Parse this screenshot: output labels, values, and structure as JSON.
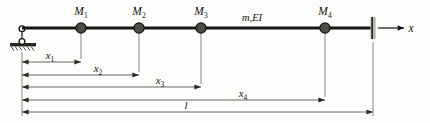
{
  "figure": {
    "type": "structural-beam-diagram",
    "colors": {
      "beam": "#171512",
      "mass_fill": "#4d4b48",
      "mass_stroke": "#141210",
      "dimension_line": "#55534f",
      "ground_hatch": "#26241f",
      "wall": "#b9b7b2",
      "background": "#fdfdfc"
    },
    "axis": {
      "label": "x"
    },
    "beam_property_label": "m,EI",
    "masses": [
      {
        "label": "M",
        "subscript": "1",
        "x": 81
      },
      {
        "label": "M",
        "subscript": "2",
        "x": 139
      },
      {
        "label": "M",
        "subscript": "3",
        "x": 201
      },
      {
        "label": "M",
        "subscript": "4",
        "x": 325
      }
    ],
    "dimensions": [
      {
        "label": "x",
        "subscript": "1",
        "start": 22,
        "end": 81,
        "y": 62,
        "text_x": 50,
        "text_y": 59
      },
      {
        "label": "x",
        "subscript": "2",
        "start": 22,
        "end": 139,
        "y": 75,
        "text_x": 98,
        "text_y": 72
      },
      {
        "label": "x",
        "subscript": "3",
        "start": 22,
        "end": 201,
        "y": 87,
        "text_x": 160,
        "text_y": 84
      },
      {
        "label": "x",
        "subscript": "4",
        "start": 22,
        "end": 325,
        "y": 100,
        "text_x": 243,
        "text_y": 97
      },
      {
        "label": "l",
        "subscript": "",
        "start": 22,
        "end": 373,
        "y": 112,
        "text_x": 186,
        "text_y": 109
      }
    ],
    "supports": {
      "left": {
        "type": "pin-roller-on-ground",
        "x": 22,
        "y": 28
      },
      "right": {
        "type": "fixed-wall",
        "x": 373,
        "y": 28
      }
    },
    "beam": {
      "x_start": 22,
      "x_end": 373,
      "y": 28
    }
  }
}
